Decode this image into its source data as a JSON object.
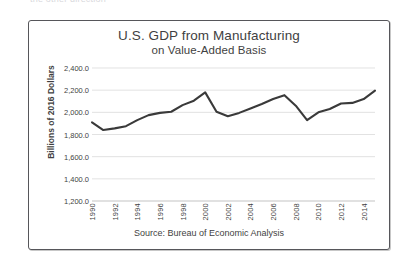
{
  "clipped_top_text": "the other direction",
  "chart_data": {
    "type": "line",
    "title": "U.S. GDP from Manufacturing",
    "subtitle": "on Value-Added Basis",
    "xlabel": "",
    "ylabel": "Billions of 2016 Dollars",
    "source": "Source: Bureau of Economic Analysis",
    "grid": true,
    "legend": "none",
    "ylim": [
      1200,
      2400
    ],
    "ytick_labels": [
      "2,400.0",
      "2,200.0",
      "2,000.0",
      "1,800.0",
      "1,600.0",
      "1,400.0",
      "1,200.0"
    ],
    "ytick_values": [
      2400,
      2200,
      2000,
      1800,
      1600,
      1400,
      1200
    ],
    "xlim": [
      1990,
      2015
    ],
    "xtick_labels": [
      "1990",
      "1992",
      "1994",
      "1996",
      "1998",
      "2000",
      "2002",
      "2004",
      "2006",
      "2008",
      "2010",
      "2012",
      "2014"
    ],
    "xtick_values": [
      1990,
      1992,
      1994,
      1996,
      1998,
      2000,
      2002,
      2004,
      2006,
      2008,
      2010,
      2012,
      2014
    ],
    "x": [
      1990,
      1991,
      1992,
      1993,
      1994,
      1995,
      1996,
      1997,
      1998,
      1999,
      2000,
      2001,
      2002,
      2003,
      2004,
      2005,
      2006,
      2007,
      2008,
      2009,
      2010,
      2011,
      2012,
      2013,
      2014,
      2015
    ],
    "values": [
      1910,
      1840,
      1855,
      1875,
      1930,
      1975,
      1995,
      2005,
      2065,
      2105,
      2180,
      2005,
      1965,
      1995,
      2035,
      2075,
      2120,
      2155,
      2060,
      1930,
      2000,
      2030,
      2080,
      2085,
      2120,
      2195
    ],
    "series_color": "#3a3a3a",
    "grid_color": "#d6d6d6"
  }
}
